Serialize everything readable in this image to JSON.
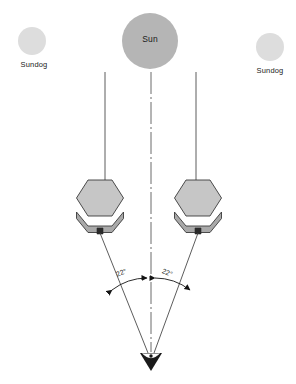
{
  "figure": {
    "background_color": "#ffffff"
  },
  "celestial": {
    "sun": {
      "label": "Sun",
      "cx": 150,
      "cy": 41,
      "r": 28,
      "fill": "#b5b5b5"
    },
    "sundogs": [
      {
        "label": "Sundog",
        "side": "left",
        "cx": 32,
        "cy": 41,
        "r": 14,
        "fill": "#dddddd"
      },
      {
        "label": "Sundog",
        "side": "right",
        "cx": 270,
        "cy": 47,
        "r": 14,
        "fill": "#dddddd"
      }
    ]
  },
  "crystals": [
    {
      "name": "ice-crystal-left",
      "cx": 100,
      "cy": 204,
      "fill": "#c6c6c6",
      "edge_fill": "#b0b0b0",
      "stroke": "#3a3a3a"
    },
    {
      "name": "ice-crystal-right",
      "cx": 198,
      "cy": 204,
      "fill": "#c6c6c6",
      "edge_fill": "#b0b0b0",
      "stroke": "#3a3a3a"
    }
  ],
  "rays": {
    "incoming": [
      {
        "name": "incoming-ray-left",
        "x": 105,
        "y_top": 72,
        "y_bottom": 182,
        "style": "solid"
      },
      {
        "name": "center-axis",
        "x": 151,
        "y_top": 72,
        "y_bottom": 352,
        "style": "dash-dot"
      },
      {
        "name": "incoming-ray-right",
        "x": 196,
        "y_top": 72,
        "y_bottom": 182,
        "style": "solid"
      }
    ],
    "refracted": [
      {
        "name": "refracted-ray-left",
        "from_x": 100,
        "from_y": 233,
        "to_x": 148,
        "to_y": 352
      },
      {
        "name": "refracted-ray-right",
        "from_x": 198,
        "from_y": 233,
        "to_x": 154,
        "to_y": 352
      }
    ]
  },
  "angles": {
    "left": {
      "label": "22°",
      "value": 22,
      "unit": "degrees"
    },
    "right": {
      "label": "22°",
      "value": 22,
      "unit": "degrees"
    }
  },
  "observer": {
    "name": "observer-eye",
    "x": 151,
    "y": 358,
    "fill": "#1a1a1a"
  },
  "colors": {
    "sun_gray": "#b5b5b5",
    "sundog_gray": "#dddddd",
    "crystal_gray": "#c6c6c6",
    "crystal_edge_gray": "#b0b0b0",
    "line_dark": "#3a3a3a",
    "text_dark": "#1a1a1a"
  }
}
